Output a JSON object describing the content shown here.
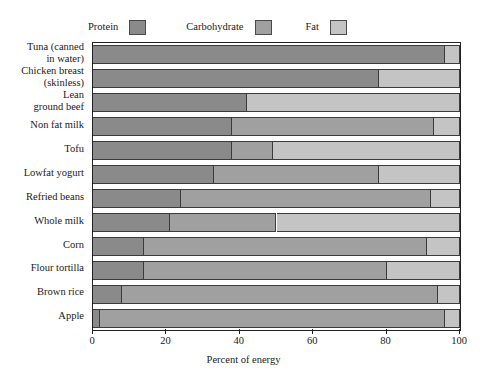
{
  "chart_data": {
    "type": "bar",
    "orientation": "horizontal",
    "stacked": true,
    "title": "",
    "xlabel": "Percent of energy",
    "ylabel": "",
    "xlim": [
      0,
      100
    ],
    "xticks": [
      0,
      20,
      40,
      60,
      80,
      100
    ],
    "grid": false,
    "legend_position": "top",
    "categories": [
      "Tuna (canned\nin water)",
      "Chicken breast\n (skinless)",
      "Lean\n  ground beef",
      "Non fat milk",
      "Tofu",
      "Lowfat yogurt",
      "Refried beans",
      "Whole milk",
      "Corn",
      "Flour tortilla",
      "Brown rice",
      "Apple"
    ],
    "series": [
      {
        "name": "Protein",
        "color": "#8a8a8a",
        "values": [
          96,
          78,
          42,
          38,
          38,
          33,
          24,
          21,
          14,
          14,
          8,
          2
        ]
      },
      {
        "name": "Carbohydrate",
        "color": "#a0a0a0",
        "values": [
          0,
          0,
          0,
          55,
          11,
          45,
          68,
          29,
          77,
          66,
          86,
          94
        ]
      },
      {
        "name": "Fat",
        "color": "#c4c4c4",
        "values": [
          4,
          22,
          58,
          7,
          51,
          22,
          8,
          50,
          9,
          20,
          6,
          4
        ]
      }
    ]
  },
  "legend": {
    "entries": [
      {
        "label": "Protein",
        "color": "#8a8a8a"
      },
      {
        "label": "Carbohydrate",
        "color": "#a0a0a0"
      },
      {
        "label": "Fat",
        "color": "#c4c4c4"
      }
    ]
  },
  "axis": {
    "x_title": "Percent of energy",
    "x_tick_labels": [
      "0",
      "20",
      "40",
      "60",
      "80",
      "100"
    ]
  },
  "colors": {
    "protein": "#8a8a8a",
    "carbohydrate": "#a0a0a0",
    "fat": "#c4c4c4",
    "frame": "#222222",
    "segment_border": "#3b3b3b",
    "background": "#ffffff",
    "text": "#1a1a1a"
  }
}
